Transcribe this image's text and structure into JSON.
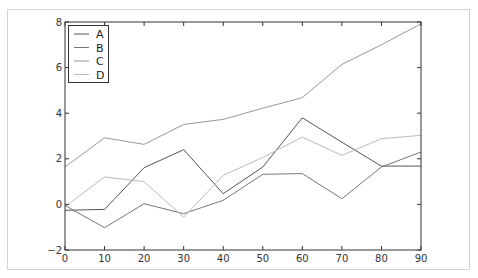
{
  "chart_data": {
    "type": "line",
    "title": "",
    "xlabel": "",
    "ylabel": "",
    "x": [
      0,
      10,
      20,
      30,
      40,
      50,
      60,
      70,
      80,
      90
    ],
    "xlim": [
      0,
      90
    ],
    "ylim": [
      -2,
      8
    ],
    "xticks": [
      "0",
      "10",
      "20",
      "30",
      "40",
      "50",
      "60",
      "70",
      "80",
      "90"
    ],
    "yticks": [
      "-2",
      "0",
      "2",
      "4",
      "6",
      "8"
    ],
    "grid": false,
    "legend_position": "upper left",
    "series": [
      {
        "name": "A",
        "color": "#555555",
        "values": [
          -0.26,
          -0.22,
          1.61,
          2.4,
          0.47,
          1.64,
          3.8,
          2.73,
          1.68,
          1.68
        ]
      },
      {
        "name": "B",
        "color": "#777777",
        "values": [
          -0.05,
          -1.02,
          0.03,
          -0.41,
          0.18,
          1.32,
          1.35,
          0.25,
          1.64,
          2.3
        ]
      },
      {
        "name": "C",
        "color": "#999999",
        "values": [
          1.64,
          2.92,
          2.63,
          3.51,
          3.73,
          4.22,
          4.68,
          6.14,
          7.0,
          7.92
        ]
      },
      {
        "name": "D",
        "color": "#bbbbbb",
        "values": [
          -0.1,
          1.2,
          1.0,
          -0.56,
          1.27,
          2.06,
          2.95,
          2.15,
          2.88,
          3.03
        ]
      }
    ]
  },
  "legend": {
    "items": [
      {
        "label": "A"
      },
      {
        "label": "B"
      },
      {
        "label": "C"
      },
      {
        "label": "D"
      }
    ]
  }
}
